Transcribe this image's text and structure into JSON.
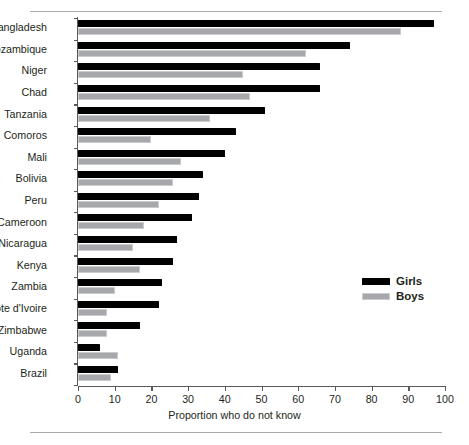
{
  "chart_data": {
    "type": "bar",
    "orientation": "horizontal",
    "title": "",
    "xlabel": "Proportion who do not know",
    "ylabel": "",
    "xlim": [
      0,
      100
    ],
    "xticks": [
      0,
      10,
      20,
      30,
      40,
      50,
      60,
      70,
      80,
      90,
      100
    ],
    "grid": false,
    "legend_position": "middle-right",
    "categories": [
      "Bangladesh",
      "Mozambique",
      "Niger",
      "Chad",
      "Tanzania",
      "Comoros",
      "Mali",
      "Bolivia",
      "Peru",
      "Cameroon",
      "Nicaragua",
      "Kenya",
      "Zambia",
      "Côte d'Ivoire",
      "Zimbabwe",
      "Uganda",
      "Brazil"
    ],
    "series": [
      {
        "name": "Girls",
        "color": "#000000",
        "values": [
          97,
          74,
          66,
          66,
          51,
          43,
          40,
          34,
          33,
          31,
          27,
          26,
          23,
          22,
          17,
          6,
          11
        ]
      },
      {
        "name": "Boys",
        "color": "#a6a8ab",
        "values": [
          88,
          62,
          45,
          47,
          36,
          20,
          28,
          26,
          22,
          18,
          15,
          17,
          10,
          8,
          8,
          11,
          9
        ]
      }
    ]
  },
  "legend": {
    "items": [
      {
        "label": "Girls",
        "swatch": "girls"
      },
      {
        "label": "Boys",
        "swatch": "boys"
      }
    ]
  }
}
